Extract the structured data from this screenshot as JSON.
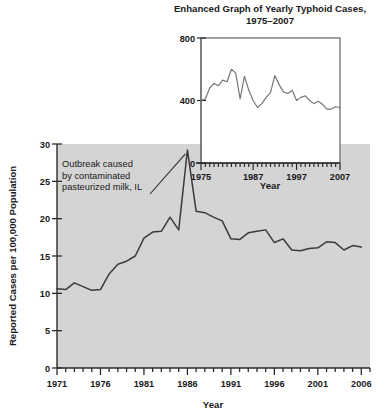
{
  "chart_data": [
    {
      "id": "main",
      "type": "line",
      "title": "",
      "xlabel": "Year",
      "ylabel": "Reported Cases per 100,000 Population",
      "xlim": [
        1971,
        2007
      ],
      "ylim": [
        0,
        30
      ],
      "ytick_labels": [
        "0",
        "5",
        "10",
        "15",
        "20",
        "25",
        "30"
      ],
      "yticks": [
        0,
        5,
        10,
        15,
        20,
        25,
        30
      ],
      "xtick_labels": [
        "1971",
        "1976",
        "1981",
        "1986",
        "1991",
        "1996",
        "2001",
        "2006"
      ],
      "xticks": [
        1971,
        1976,
        1981,
        1986,
        1991,
        1996,
        2001,
        2006
      ],
      "grid": false,
      "legend": "none",
      "plot_bg": "#d4d4d4",
      "line_color": "#3a3a3a",
      "x": [
        1971,
        1972,
        1973,
        1974,
        1975,
        1976,
        1977,
        1978,
        1979,
        1980,
        1981,
        1982,
        1983,
        1984,
        1985,
        1986,
        1987,
        1988,
        1989,
        1990,
        1991,
        1992,
        1993,
        1994,
        1995,
        1996,
        1997,
        1998,
        1999,
        2000,
        2001,
        2002,
        2003,
        2004,
        2005,
        2006
      ],
      "values": [
        10.6,
        10.5,
        11.4,
        10.9,
        10.4,
        10.5,
        12.6,
        13.9,
        14.3,
        15.0,
        17.4,
        18.2,
        18.3,
        20.2,
        18.5,
        29.2,
        21.0,
        20.8,
        20.2,
        19.7,
        17.3,
        17.2,
        18.1,
        18.3,
        18.5,
        16.8,
        17.3,
        15.8,
        15.7,
        16.0,
        16.1,
        16.9,
        16.8,
        15.8,
        16.4,
        16.2
      ],
      "annotation": {
        "text": "Outbreak caused by contaminated pasteurized milk, IL",
        "lines": [
          "Outbreak caused",
          "by contaminated",
          "pasteurized milk, IL"
        ],
        "points_to_year": 1986,
        "points_to_value": 29.2
      }
    },
    {
      "id": "inset",
      "type": "line",
      "title": "Enhanced Graph of Yearly Typhoid Cases, 1975–2007",
      "title_lines": [
        "Enhanced Graph of Yearly Typhoid Cases,",
        "1975–2007"
      ],
      "xlabel": "Year",
      "ylabel": "",
      "xlim": [
        1975,
        2007
      ],
      "ylim": [
        0,
        800
      ],
      "ytick_labels": [
        "0",
        "400",
        "800"
      ],
      "yticks": [
        0,
        400,
        800
      ],
      "xtick_labels": [
        "1975",
        "1987",
        "1997",
        "2007"
      ],
      "xticks": [
        1975,
        1987,
        1997,
        2007
      ],
      "grid": false,
      "legend": "none",
      "plot_bg": "#ffffff",
      "line_color": "#777777",
      "x": [
        1975,
        1976,
        1977,
        1978,
        1979,
        1980,
        1981,
        1982,
        1983,
        1984,
        1985,
        1986,
        1987,
        1988,
        1989,
        1990,
        1991,
        1992,
        1993,
        1994,
        1995,
        1996,
        1997,
        1998,
        1999,
        2000,
        2001,
        2002,
        2003,
        2004,
        2005,
        2006,
        2007
      ],
      "values": [
        400,
        410,
        480,
        510,
        495,
        530,
        520,
        600,
        575,
        410,
        555,
        465,
        400,
        355,
        380,
        420,
        450,
        560,
        500,
        455,
        445,
        465,
        400,
        420,
        430,
        400,
        380,
        395,
        375,
        345,
        345,
        360,
        355
      ]
    }
  ],
  "main_chart": {
    "y_axis_label": "Reported Cases per 100,000 Population",
    "x_axis_label": "Year",
    "y_ticks": [
      "30",
      "25",
      "20",
      "15",
      "10",
      "5",
      "0"
    ],
    "x_ticks": [
      "1971",
      "1976",
      "1981",
      "1986",
      "1991",
      "1996",
      "2001",
      "2006"
    ],
    "annotation_line1": "Outbreak caused",
    "annotation_line2": "by contaminated",
    "annotation_line3": "pasteurized milk, IL"
  },
  "inset_chart": {
    "title_line1": "Enhanced Graph of Yearly Typhoid Cases,",
    "title_line2": "1975–2007",
    "x_axis_label": "Year",
    "y_ticks": [
      "800",
      "400",
      "0"
    ],
    "x_ticks": [
      "1975",
      "1987",
      "1997",
      "2007"
    ]
  },
  "colors": {
    "plot_background": "#d4d4d4",
    "main_line": "#3a3a3a",
    "inset_line": "#777777",
    "axis": "#2b2b2b",
    "text": "#1a1a1a"
  }
}
